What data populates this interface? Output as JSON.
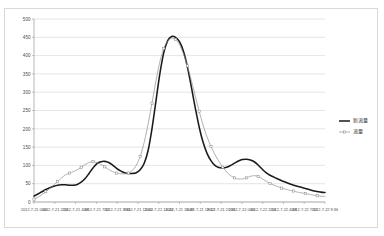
{
  "chart_data": {
    "type": "line",
    "title": "",
    "xlabel": "",
    "ylabel": "",
    "ylim": [
      0,
      500
    ],
    "ytick_step": 50,
    "grid": true,
    "legend_position": "right",
    "yticks": [
      "0",
      "50",
      "100",
      "150",
      "200",
      "250",
      "300",
      "350",
      "400",
      "450",
      "500"
    ],
    "xticks": [
      "2012-7-21 0:00",
      "2012-7-21 2:24",
      "2012-7-21 4:48",
      "2012-7-21 7:12",
      "2012-7-21 9:36",
      "2012-7-21 12:00",
      "2012-7-21 14:24",
      "2012-7-21 16:48",
      "2012-7-21 19:12",
      "2012-7-21 21:36",
      "2012-7-22 0:00",
      "2012-7-22 2:24",
      "2012-7-22 4:48",
      "2012-7-22 7:12",
      "2012-7-22 9:36"
    ],
    "series": [
      {
        "name": "新流量",
        "color": "#1a1a1a",
        "style": "smooth-thick",
        "marker": "none",
        "values": [
          16,
          22,
          28,
          34,
          39,
          43,
          46,
          47,
          47,
          46,
          46,
          48,
          54,
          64,
          78,
          93,
          105,
          110,
          111,
          108,
          101,
          92,
          85,
          80,
          78,
          78,
          80,
          88,
          105,
          140,
          200,
          275,
          350,
          408,
          441,
          452,
          450,
          438,
          412,
          370,
          315,
          258,
          205,
          163,
          133,
          113,
          100,
          94,
          93,
          95,
          100,
          106,
          112,
          116,
          117,
          115,
          110,
          101,
          90,
          80,
          73,
          68,
          63,
          58,
          54,
          50,
          46,
          43,
          40,
          37,
          34,
          31,
          29,
          27,
          26
        ]
      },
      {
        "name": "流量",
        "color": "#8c8c8c",
        "style": "line-marker",
        "marker": "square",
        "values": [
          8,
          13,
          20,
          28,
          37,
          46,
          56,
          66,
          74,
          79,
          83,
          88,
          95,
          102,
          108,
          110,
          108,
          103,
          96,
          89,
          83,
          79,
          77,
          77,
          79,
          86,
          100,
          124,
          162,
          212,
          270,
          330,
          383,
          420,
          440,
          447,
          444,
          430,
          405,
          372,
          333,
          290,
          248,
          210,
          178,
          152,
          130,
          111,
          95,
          82,
          72,
          66,
          63,
          63,
          66,
          70,
          72,
          70,
          64,
          57,
          51,
          46,
          42,
          38,
          35,
          32,
          30,
          27,
          25,
          23,
          21,
          19,
          17,
          16,
          15
        ]
      }
    ]
  },
  "legend": {
    "entries": [
      {
        "label": "新流量"
      },
      {
        "label": "流量"
      }
    ]
  }
}
